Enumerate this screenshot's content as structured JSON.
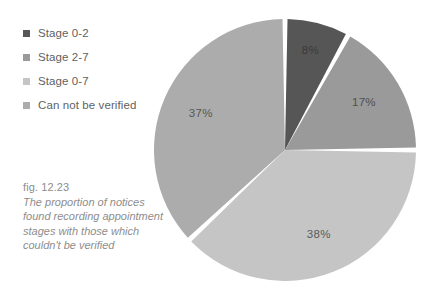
{
  "legend": {
    "items": [
      {
        "label": "Stage 0-2",
        "color": "#565656"
      },
      {
        "label": "Stage 2-7",
        "color": "#9a9a9a"
      },
      {
        "label": "Stage 0-7",
        "color": "#c5c5c5"
      },
      {
        "label": "Can not be verified",
        "color": "#acacac"
      }
    ]
  },
  "caption": {
    "figure_number": "fig. 12.23",
    "text": "The proportion of notices found recording appointment stages with those which couldn't be verified"
  },
  "chart_data": {
    "type": "pie",
    "title": "",
    "legend_position": "left",
    "categories": [
      "Stage 0-2",
      "Stage 2-7",
      "Stage 0-7",
      "Can not be verified"
    ],
    "values": [
      8,
      17,
      38,
      37
    ],
    "unit": "%",
    "data_labels": [
      "8%",
      "17%",
      "38%",
      "37%"
    ],
    "colors": [
      "#565656",
      "#9a9a9a",
      "#c5c5c5",
      "#acacac"
    ],
    "label_colors": [
      "#3b3b3b",
      "#4f4f4f",
      "#595959",
      "#575757"
    ],
    "separator_color": "#ffffff",
    "start_angle_deg": 0,
    "direction": "clockwise"
  }
}
